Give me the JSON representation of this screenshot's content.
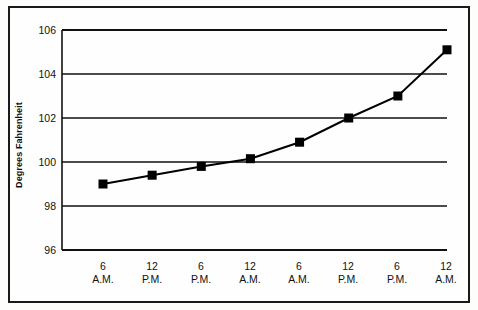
{
  "chart_data": {
    "type": "line",
    "title": "",
    "xlabel": "",
    "ylabel": "Degrees Fahrenheit",
    "ylim": [
      96,
      106
    ],
    "yticks": [
      96,
      98,
      100,
      102,
      104,
      106
    ],
    "ytick_labels": [
      "96",
      "98",
      "100",
      "102",
      "104",
      "106"
    ],
    "grid": true,
    "grid_axis": "y",
    "legend": false,
    "categories": [
      "6 A.M.",
      "12 P.M.",
      "6 P.M.",
      "12 A.M.",
      "6 A.M.",
      "12 P.M.",
      "6 P.M.",
      "12 A.M."
    ],
    "xtick_hours": [
      "6",
      "12",
      "6",
      "12",
      "6",
      "12",
      "6",
      "12"
    ],
    "xtick_periods": [
      "A.M.",
      "P.M.",
      "P.M.",
      "A.M.",
      "A.M.",
      "P.M.",
      "P.M.",
      "A.M."
    ],
    "values": [
      99.0,
      99.4,
      99.8,
      100.15,
      100.9,
      102.0,
      103.0,
      105.1
    ],
    "series": [
      {
        "name": "Temperature",
        "values": [
          99.0,
          99.4,
          99.8,
          100.15,
          100.9,
          102.0,
          103.0,
          105.1
        ]
      }
    ],
    "marker": "square",
    "marker_color": "#000000",
    "line_color": "#000000",
    "line_width": 2
  },
  "colors": {
    "frame": "#1a1a1a",
    "grid": "#111111",
    "background": "#fefefe",
    "text": "#111111"
  }
}
